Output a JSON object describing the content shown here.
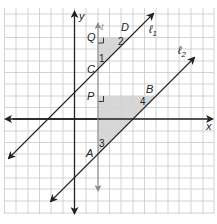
{
  "diagram": {
    "type": "coordinate-geometry",
    "colors": {
      "background": "#ffffff",
      "grid": "#c8c8c8",
      "axis": "#222222",
      "line": "#222222",
      "transversal": "#8a8a8a",
      "shade": "#d3d3d3"
    },
    "axes": {
      "x_label": "x",
      "y_label": "y"
    },
    "lines": [
      {
        "id": "l1",
        "label": "ℓ",
        "subscript": "1"
      },
      {
        "id": "l2",
        "label": "ℓ",
        "subscript": "2"
      },
      {
        "id": "t",
        "label": "t"
      }
    ],
    "points": [
      {
        "id": "Q",
        "label": "Q"
      },
      {
        "id": "D",
        "label": "D"
      },
      {
        "id": "C",
        "label": "C"
      },
      {
        "id": "P",
        "label": "P"
      },
      {
        "id": "B",
        "label": "B"
      },
      {
        "id": "A",
        "label": "A"
      }
    ],
    "angles": [
      {
        "id": "angle1",
        "label": "1"
      },
      {
        "id": "angle2",
        "label": "2"
      },
      {
        "id": "angle3",
        "label": "3"
      },
      {
        "id": "angle4",
        "label": "4"
      }
    ],
    "triangles": [
      {
        "id": "triangle-QDC",
        "vertices": [
          "Q",
          "D",
          "C"
        ],
        "right_angle_at": "Q"
      },
      {
        "id": "triangle-PBA",
        "vertices": [
          "P",
          "B",
          "A"
        ],
        "right_angle_at": "P"
      }
    ]
  }
}
